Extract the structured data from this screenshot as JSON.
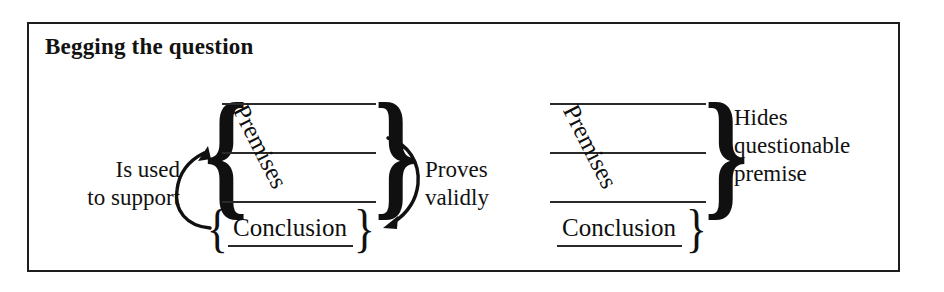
{
  "figure": {
    "title": "Begging the question",
    "border_color": "#1d1d1d",
    "ink_color": "#111111",
    "background": "#ffffff"
  },
  "left_diagram": {
    "name": "valid-circular-argument",
    "premises_label": "Premises",
    "premises_line_count": 3,
    "conclusion_label": "Conclusion",
    "has_left_brace": true,
    "has_right_brace": true,
    "conclusion_left_brace": "{",
    "conclusion_right_brace": "}",
    "left_annotation": {
      "line1": "Is used",
      "line2": "to support"
    },
    "right_annotation": {
      "line1": "Proves",
      "line2": "validly"
    },
    "arrows": [
      {
        "name": "is-used-to-support-arrow",
        "from": "conclusion",
        "to": "premises",
        "direction": "up"
      },
      {
        "name": "proves-validly-arrow",
        "from": "premises",
        "to": "conclusion",
        "direction": "down"
      }
    ]
  },
  "right_diagram": {
    "name": "hidden-questionable-premise",
    "premises_label": "Premises",
    "premises_line_count": 3,
    "conclusion_label": "Conclusion",
    "has_left_brace": false,
    "has_right_brace": true,
    "conclusion_right_brace": "}",
    "right_annotation": {
      "line1": "Hides",
      "line2": "questionable",
      "line3": "premise"
    }
  }
}
